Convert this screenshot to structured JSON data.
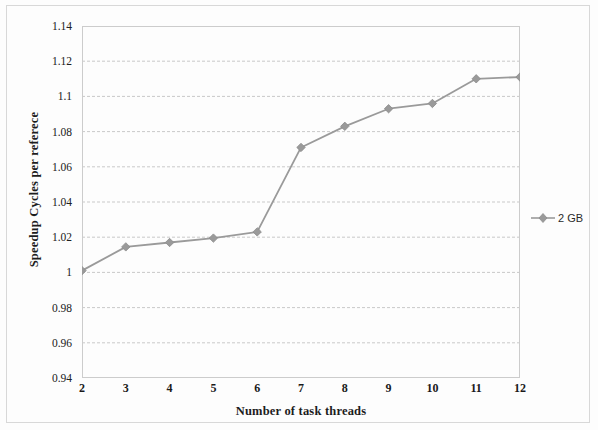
{
  "chart_data": {
    "type": "line",
    "title": "",
    "subtitle": "",
    "xlabel": "Number of task threads",
    "ylabel": "Speedup Cycles per referece",
    "x": [
      2,
      3,
      4,
      5,
      6,
      7,
      8,
      9,
      10,
      11,
      12
    ],
    "xtick_labels": [
      "2",
      "3",
      "4",
      "5",
      "6",
      "7",
      "8",
      "9",
      "10",
      "11",
      "12"
    ],
    "ytick_labels": [
      "1.14",
      "1.12",
      "1.1",
      "1.08",
      "1.06",
      "1.04",
      "1.02",
      "1",
      "0.98",
      "0.96",
      "0.94"
    ],
    "ytick_values": [
      1.14,
      1.12,
      1.1,
      1.08,
      1.06,
      1.04,
      1.02,
      1.0,
      0.98,
      0.96,
      0.94
    ],
    "xlim": [
      2,
      12
    ],
    "ylim": [
      0.94,
      1.14
    ],
    "grid": "horizontal-dashed",
    "legend_position": "right",
    "series": [
      {
        "name": "2 GB",
        "color": "#9a9a9a",
        "marker": "diamond",
        "values": [
          1.001,
          1.0145,
          1.017,
          1.0195,
          1.023,
          1.071,
          1.083,
          1.093,
          1.096,
          1.11,
          1.111
        ]
      }
    ]
  },
  "legend": {
    "entries": [
      {
        "label": "2 GB",
        "color": "#9a9a9a",
        "marker": "diamond"
      }
    ]
  },
  "icons": {
    "legend_marker": "diamond-marker-icon"
  }
}
